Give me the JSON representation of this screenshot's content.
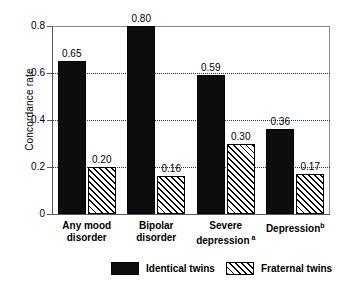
{
  "chart_data": {
    "type": "bar",
    "title": "",
    "xlabel": "",
    "ylabel": "Concordance rate",
    "ylim": [
      0,
      0.8
    ],
    "yticks": [
      "0",
      "0.2",
      "0.4",
      "0.6",
      "0.8"
    ],
    "ytick_values": [
      0,
      0.2,
      0.4,
      0.6,
      0.8
    ],
    "gridlines": [
      0.2,
      0.4,
      0.6
    ],
    "grid": true,
    "legend_position": "bottom",
    "categories": [
      {
        "line1": "Any mood",
        "line2": "disorder",
        "sup": ""
      },
      {
        "line1": "Bipolar",
        "line2": "disorder",
        "sup": ""
      },
      {
        "line1": "Severe",
        "line2": "depression",
        "sup": "a"
      },
      {
        "line1": "Depression",
        "line2": "",
        "sup": "b"
      }
    ],
    "series": [
      {
        "name": "Identical twins",
        "fill": "solid",
        "color": "#0d0d0d",
        "values": [
          0.65,
          0.8,
          0.59,
          0.36
        ],
        "labels": [
          "0.65",
          "0.80",
          "0.59",
          "0.36"
        ]
      },
      {
        "name": "Fraternal twins",
        "fill": "hatch",
        "color": "#ffffff",
        "values": [
          0.2,
          0.16,
          0.3,
          0.17
        ],
        "labels": [
          "0.20",
          "0.16",
          "0.30",
          "0.17"
        ]
      }
    ]
  },
  "legend": {
    "items": [
      {
        "label": "Identical twins",
        "fill": "solid"
      },
      {
        "label": "Fraternal twins",
        "fill": "hatch"
      }
    ]
  }
}
